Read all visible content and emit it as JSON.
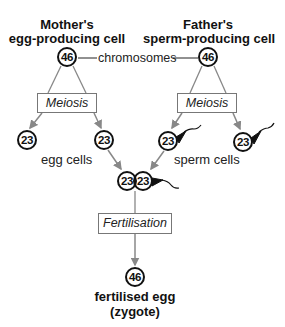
{
  "parents": {
    "mother": {
      "line1": "Mother's",
      "line2": "egg-producing cell",
      "chromosomes": "46"
    },
    "father": {
      "line1": "Father's",
      "line2": "sperm-producing cell",
      "chromosomes": "46"
    }
  },
  "chromosomes_label": "chromosomes",
  "process": {
    "meiosis_left": "Meiosis",
    "meiosis_right": "Meiosis",
    "fertilisation": "Fertilisation"
  },
  "gametes": {
    "egg_cells": {
      "label": "egg cells",
      "counts": [
        "23",
        "23"
      ]
    },
    "sperm_cells": {
      "label": "sperm cells",
      "counts": [
        "23",
        "23"
      ]
    }
  },
  "fusion": {
    "egg": "23",
    "sperm": "23"
  },
  "zygote": {
    "chromosomes": "46",
    "line1": "fertilised egg",
    "line2": "(zygote)"
  },
  "colors": {
    "line": "#888888",
    "cell_border": "#111111",
    "box_border": "#777777"
  }
}
